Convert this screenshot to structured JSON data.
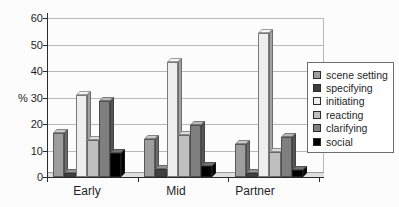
{
  "chart_data": {
    "type": "bar",
    "style": "3d-clustered-column-grayscale",
    "title": "",
    "categories": [
      "Early",
      "Mid",
      "Partner"
    ],
    "series": [
      {
        "name": "scene setting",
        "color": "#9e9e9e",
        "values": [
          16.5,
          14.5,
          12.5
        ]
      },
      {
        "name": "specifying",
        "color": "#404040",
        "values": [
          1.5,
          3,
          1.5
        ]
      },
      {
        "name": "initiating",
        "color": "#eeeeee",
        "values": [
          31,
          43.5,
          54.5
        ]
      },
      {
        "name": "reacting",
        "color": "#bfbfbf",
        "values": [
          14,
          16,
          9.5
        ]
      },
      {
        "name": "clarifying",
        "color": "#7f7f7f",
        "values": [
          28.5,
          19.5,
          15
        ]
      },
      {
        "name": "social",
        "color": "#000000",
        "values": [
          9,
          4,
          2.5
        ]
      }
    ],
    "xlabel": "",
    "ylabel": "%",
    "ylim": [
      0,
      60
    ],
    "ytick_step": 10,
    "y_ticks": [
      "0",
      "10",
      "20",
      "30",
      "40",
      "50",
      "60"
    ],
    "grid": true,
    "legend_position": "right",
    "legend_items": [
      "scene setting",
      "specifying",
      "initiating",
      "reacting",
      "clarifying",
      "social"
    ]
  }
}
